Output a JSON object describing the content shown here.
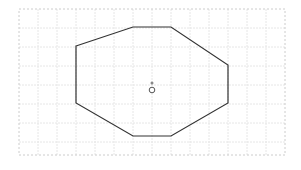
{
  "canvas": {
    "width": 301,
    "height": 170,
    "background": "#ffffff"
  },
  "grid": {
    "x0": 19,
    "y0": 9,
    "x1": 285,
    "y1": 155,
    "step": 19,
    "color": "#e6e6e6",
    "border_color": "#cccccc"
  },
  "shape": {
    "type": "octagon",
    "stroke": "#333333",
    "points": "76,46 133,27 171,27 228,65 228,103 171,136 133,136 76,103"
  },
  "markers": {
    "center_dot": {
      "cx": 152,
      "cy": 83,
      "r": 1.5,
      "color": "#888888"
    },
    "handle_circle": {
      "cx": 152,
      "cy": 90,
      "r": 2.8,
      "color": "#555555"
    }
  }
}
